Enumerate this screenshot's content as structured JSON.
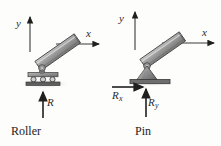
{
  "figure": {
    "background_color": "#fdfdfc",
    "width": 221,
    "height": 146
  },
  "colors": {
    "beam_fill": "#9a9a9a",
    "beam_fill_light": "#c4c4c4",
    "beam_stroke": "#4a4a4a",
    "support_fill": "#8c8c8c",
    "ground_fill": "#6d6d6d",
    "arrow_color": "#1f1f1f",
    "axis_color": "#3a3a3a",
    "text_color": "#2b2b2b"
  },
  "panels": [
    {
      "id": "roller",
      "caption": "Roller",
      "axes": {
        "y_label": "y",
        "x_label": "x"
      },
      "forces": [
        {
          "name": "R",
          "symbol": "R",
          "subscript": "",
          "direction": "up",
          "description": "vertical reaction force"
        }
      ],
      "support_type": "roller",
      "beam_angle_deg": 35
    },
    {
      "id": "pin",
      "caption": "Pin",
      "axes": {
        "y_label": "y",
        "x_label": "x"
      },
      "forces": [
        {
          "name": "Rx",
          "symbol": "R",
          "subscript": "x",
          "direction": "right",
          "description": "horizontal reaction force"
        },
        {
          "name": "Ry",
          "symbol": "R",
          "subscript": "y",
          "direction": "up",
          "description": "vertical reaction force"
        }
      ],
      "support_type": "pin",
      "beam_angle_deg": 35
    }
  ]
}
